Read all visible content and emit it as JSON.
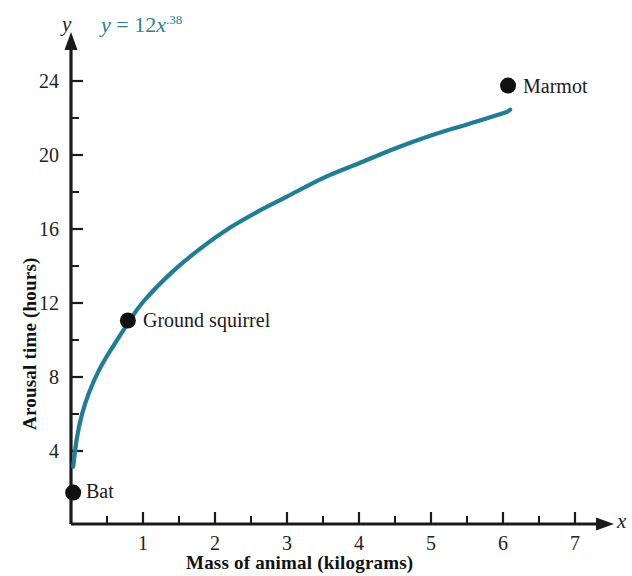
{
  "chart_data": {
    "type": "line",
    "title": "",
    "equation_label": {
      "lhs": "y",
      "operator": "=",
      "coefficient": "12",
      "variable": "x",
      "exponent": ".38",
      "full": "y = 12x.38",
      "color": "#2a7e96"
    },
    "xlabel": "Mass of animal (kilograms)",
    "ylabel": "Arousal time (hours)",
    "x_axis_variable": "x",
    "y_axis_variable": "y",
    "xlim": [
      0,
      7.6
    ],
    "ylim": [
      0,
      25.5
    ],
    "xticks": [
      1,
      2,
      3,
      4,
      5,
      6,
      7
    ],
    "xtick_labels": [
      "1",
      "2",
      "3",
      "4",
      "5",
      "6",
      "7"
    ],
    "x_minor_ticks": [
      0.5,
      1.5,
      2.5,
      3.5,
      4.5,
      5.5,
      6.5,
      7.5
    ],
    "yticks": [
      4,
      8,
      12,
      16,
      20,
      24
    ],
    "ytick_labels": [
      "4",
      "8",
      "12",
      "16",
      "20",
      "24"
    ],
    "y_minor_ticks": [
      2,
      6,
      10,
      14,
      18,
      22
    ],
    "grid": false,
    "legend": "none",
    "curve": {
      "name": "y = 12x^.38",
      "color": "#1f7d95",
      "coefficient": 12,
      "exponent": 0.38,
      "x": [
        0.03,
        0.08,
        0.15,
        0.25,
        0.4,
        0.6,
        0.8,
        1.0,
        1.4,
        1.8,
        2.2,
        2.6,
        3.0,
        3.5,
        4.0,
        4.5,
        5.0,
        5.5,
        6.0,
        6.1
      ],
      "y": [
        3.1,
        4.6,
        5.9,
        7.1,
        8.4,
        9.7,
        10.9,
        12.0,
        13.6,
        14.9,
        16.0,
        16.9,
        17.7,
        18.7,
        19.5,
        20.3,
        21.0,
        21.6,
        22.2,
        22.4
      ]
    },
    "points": [
      {
        "label": "Bat",
        "x": 0.03,
        "y": 1.7,
        "label_position": "right"
      },
      {
        "label": "Ground squirrel",
        "x": 0.79,
        "y": 11.0,
        "label_position": "right"
      },
      {
        "label": "Marmot",
        "x": 6.07,
        "y": 23.7,
        "label_position": "right"
      }
    ],
    "point_color": "#111111",
    "axis_color": "#1a1a1a"
  }
}
